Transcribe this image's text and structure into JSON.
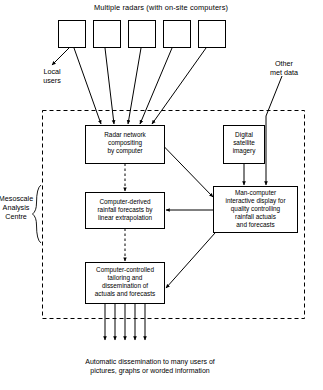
{
  "diagram": {
    "title": "Multiple radars (with on-site computers)",
    "boundary_label": "Mesoscale\nAnalysis\nCentre",
    "external_labels": {
      "local_users": "Local\nusers",
      "other_met_data": "Other\nmet data"
    },
    "caption": "Automatic dissemination to many users of\npictures, graphs or worded information",
    "radar_boxes": [
      {
        "id": "radar-1",
        "label": ""
      },
      {
        "id": "radar-2",
        "label": ""
      },
      {
        "id": "radar-3",
        "label": ""
      },
      {
        "id": "radar-4",
        "label": ""
      },
      {
        "id": "radar-5",
        "label": ""
      }
    ],
    "process_boxes": [
      {
        "id": "radar-network-compositing",
        "label": "Radar network\ncompositing\nby computer"
      },
      {
        "id": "rainfall-forecasts",
        "label": "Computer-derived\nrainfall forecasts by\nlinear extrapolation"
      },
      {
        "id": "tailoring-dissemination",
        "label": "Computer-controlled\ntailoring and\ndissemination of\nactuals and forecasts"
      },
      {
        "id": "digital-satellite-imagery",
        "label": "Digital\nsatellite\nimagery"
      },
      {
        "id": "man-computer-display",
        "label": "Man-computer\ninteractive display for\nquality controlling\nrainfall actuals\nand forecasts"
      }
    ],
    "colors": {
      "stroke": "#000000",
      "background": "#ffffff",
      "text": "#000000"
    },
    "output_arrow_count": 5
  }
}
